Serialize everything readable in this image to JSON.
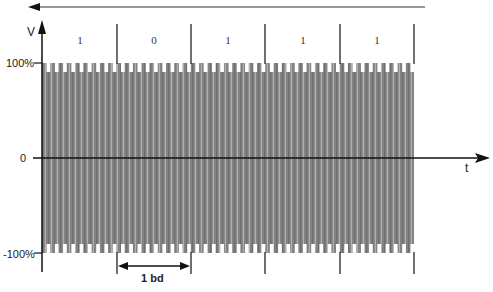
{
  "diagram": {
    "y_axis_label": "V",
    "x_axis_label": "t",
    "y_ticks": [
      {
        "label": "100%",
        "value": 100
      },
      {
        "label": "0",
        "value": 0
      },
      {
        "label": "-100%",
        "value": -100
      }
    ],
    "bits": [
      {
        "label": "1"
      },
      {
        "label": "0"
      },
      {
        "label": "1"
      },
      {
        "label": "1"
      },
      {
        "label": "1"
      }
    ],
    "baud_marker": "1 bd",
    "direction_arrow": "left",
    "colors": {
      "waveform_fill": "#8a8a8a",
      "axis": "#111111",
      "background": "#ffffff"
    }
  }
}
